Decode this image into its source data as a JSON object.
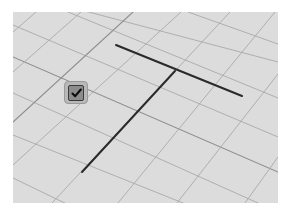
{
  "viewport": {
    "background": "#dcdcdc",
    "grid_color_minor": "#a9a9a9",
    "grid_color_major": "#8e8e8e",
    "grid": {
      "family_down_right": [
        {
          "x1": 0,
          "y1": 13,
          "x2": 265,
          "y2": 125,
          "major": false
        },
        {
          "x1": 55,
          "y1": 0,
          "x2": 265,
          "y2": 86,
          "major": false
        },
        {
          "x1": 175,
          "y1": 0,
          "x2": 265,
          "y2": 32,
          "major": false
        },
        {
          "x1": 0,
          "y1": 45,
          "x2": 265,
          "y2": 160,
          "major": true
        },
        {
          "x1": 0,
          "y1": 81,
          "x2": 265,
          "y2": 200,
          "major": false
        },
        {
          "x1": 0,
          "y1": 123,
          "x2": 180,
          "y2": 195,
          "major": false
        },
        {
          "x1": 0,
          "y1": 166,
          "x2": 60,
          "y2": 195,
          "major": false
        },
        {
          "x1": 0,
          "y1": -20,
          "x2": 265,
          "y2": 50,
          "major": false
        }
      ],
      "family_up_right": [
        {
          "x1": 0,
          "y1": 20,
          "x2": 23,
          "y2": 0,
          "major": false
        },
        {
          "x1": 0,
          "y1": 60,
          "x2": 68,
          "y2": 0,
          "major": false
        },
        {
          "x1": 0,
          "y1": 110,
          "x2": 120,
          "y2": 0,
          "major": true
        },
        {
          "x1": 0,
          "y1": 153,
          "x2": 168,
          "y2": 0,
          "major": false
        },
        {
          "x1": 39,
          "y1": 191,
          "x2": 217,
          "y2": 0,
          "major": false
        },
        {
          "x1": 105,
          "y1": 191,
          "x2": 262,
          "y2": 0,
          "major": false
        },
        {
          "x1": 164,
          "y1": 191,
          "x2": 265,
          "y2": 62,
          "major": false
        },
        {
          "x1": 232,
          "y1": 191,
          "x2": 265,
          "y2": 145,
          "major": false
        }
      ]
    },
    "drawn_lines": {
      "color": "#2a2a2a",
      "width": 2,
      "segments": [
        {
          "name": "horizontal-edge",
          "x1": 103,
          "y1": 33,
          "x2": 229,
          "y2": 84
        },
        {
          "name": "vertical-edge",
          "x1": 162,
          "y1": 59,
          "x2": 69,
          "y2": 160
        }
      ]
    }
  },
  "confirm_button": {
    "icon": "checkmark-icon",
    "tooltip": ""
  }
}
